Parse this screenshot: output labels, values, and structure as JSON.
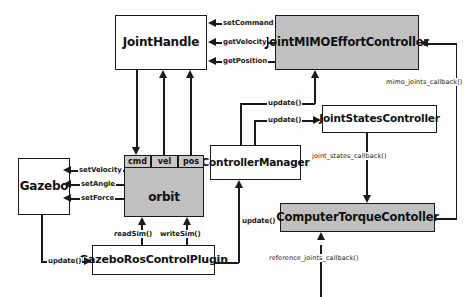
{
  "diagram": {
    "colors": {
      "node_fill_gray": "#c0c0c0",
      "node_fill_white": "#ffffff",
      "stroke": "#1a1a1a",
      "background": "#fdfdfd"
    },
    "nodes": [
      {
        "id": "joint_handle",
        "label": "JointHandle",
        "fill": "white"
      },
      {
        "id": "joint_mimo",
        "label": "JointMIMOEffortController",
        "fill": "gray"
      },
      {
        "id": "joint_states",
        "label": "JointStatesController",
        "fill": "white"
      },
      {
        "id": "controller_manager",
        "label": "ControllerManager",
        "fill": "white"
      },
      {
        "id": "computer_torque",
        "label": "ComputerTorqueContoller",
        "fill": "gray"
      },
      {
        "id": "gazebo",
        "label": "Gazebo",
        "fill": "white"
      },
      {
        "id": "orbit",
        "label": "orbit",
        "fill": "gray"
      },
      {
        "id": "gazebo_plugin",
        "label": "GazeboRosControlPlugin",
        "fill": "white"
      }
    ],
    "orbit_slots": [
      {
        "id": "cmd",
        "label": "cmd"
      },
      {
        "id": "vel",
        "label": "vel"
      },
      {
        "id": "pos",
        "label": "pos"
      }
    ],
    "edge_labels": {
      "set_command": "setCommand",
      "get_velocity": "getVelocity",
      "get_position": "getPosition",
      "mimo_joints_callback": "mimo_joints_callback()",
      "joint_states_callback": "joint_states_callback()",
      "reference_joints_callback": "reference_joints_callback()",
      "update_mimo": "update()",
      "update_states": "update()",
      "update_manager": "update()",
      "update_gazebo": "update()",
      "set_velocity": "setVelocity",
      "set_angle": "setAngle",
      "set_force": "setForce",
      "read_sim": "readSim()",
      "write_sim": "writeSim()"
    }
  }
}
